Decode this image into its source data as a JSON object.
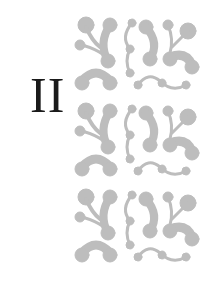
{
  "chapter": {
    "numeral": "II"
  },
  "ornament": {
    "description": "Decorative pattern of gray curling tendrils with dot terminals",
    "fill_color": "#bdbdbd",
    "tile_repeats": 3
  }
}
